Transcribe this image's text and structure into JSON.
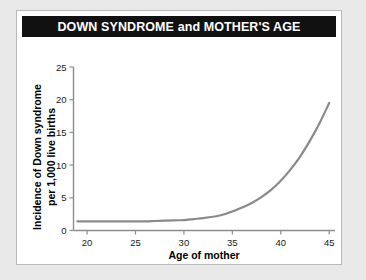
{
  "card": {
    "background_color": "#ffffff",
    "border_color": "#b9b9b9"
  },
  "banner": {
    "background_color": "#111111",
    "text_color": "#ffffff",
    "title": "DOWN SYNDROME and MOTHER'S AGE"
  },
  "chart_data": {
    "type": "line",
    "title": "DOWN SYNDROME and MOTHER'S AGE",
    "xlabel": "Age of mother",
    "ylabel": "Incidence of Down syndrome per 1,000 live births",
    "ylabel_line1": "Incidence of Down syndrome",
    "ylabel_line2": "per 1,000 live births",
    "xlim": [
      18.6,
      45.6
    ],
    "ylim": [
      0,
      25
    ],
    "xticks": [
      20,
      25,
      30,
      35,
      40,
      45
    ],
    "yticks": [
      0,
      5,
      10,
      15,
      20,
      25
    ],
    "xtick_labels": [
      "20",
      "25",
      "30",
      "35",
      "40",
      "45"
    ],
    "ytick_labels": [
      "0",
      "5",
      "10",
      "15",
      "20",
      "25"
    ],
    "grid": false,
    "legend": "none",
    "series": [
      {
        "name": "Incidence of Down syndrome",
        "color": "#8a8a8a",
        "line_width": 2.2,
        "x": [
          19,
          20,
          21,
          22,
          23,
          24,
          25,
          26,
          27,
          28,
          29,
          30,
          31,
          32,
          33,
          34,
          35,
          36,
          37,
          38,
          39,
          40,
          41,
          42,
          43,
          44,
          45
        ],
        "values": [
          1.4,
          1.4,
          1.4,
          1.4,
          1.4,
          1.4,
          1.4,
          1.4,
          1.45,
          1.5,
          1.55,
          1.6,
          1.75,
          1.9,
          2.1,
          2.4,
          2.9,
          3.5,
          4.2,
          5.1,
          6.2,
          7.6,
          9.3,
          11.3,
          13.7,
          16.4,
          19.5
        ]
      }
    ]
  },
  "axes": {
    "axis_line_color": "#8c8c8c",
    "tick_label_color": "#1a1a1a"
  }
}
